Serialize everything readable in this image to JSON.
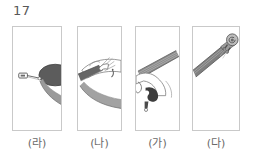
{
  "question": {
    "number": "17"
  },
  "panels": [
    {
      "label": "(라)",
      "icon": "violin-endpin-tailpiece-illustration",
      "x": 12,
      "width": 50
    },
    {
      "label": "(나)",
      "icon": "violin-body-bridge-strings-illustration",
      "x": 77,
      "width": 45
    },
    {
      "label": "(가)",
      "icon": "violin-neck-fingerboard-f-hole-illustration",
      "x": 135,
      "width": 45
    },
    {
      "label": "(다)",
      "icon": "violin-scroll-pegbox-illustration",
      "x": 192,
      "width": 48
    }
  ],
  "colors": {
    "border": "#c9c9c9",
    "text": "#585858",
    "label_text": "#6a6a6a",
    "ink_dark": "#4a4a4a",
    "ink_mid": "#8d8d8d",
    "ink_light": "#c4c4c4",
    "background": "#ffffff"
  }
}
